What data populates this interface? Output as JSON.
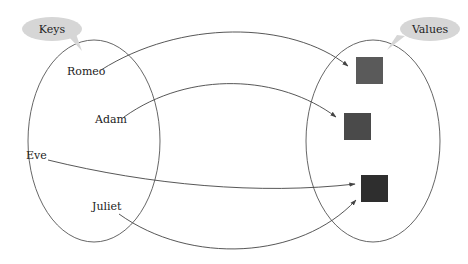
{
  "diagram": {
    "keys_set": {
      "title": "Keys",
      "items": [
        "Romeo",
        "Adam",
        "Eve",
        "Juliet"
      ]
    },
    "values_set": {
      "title": "Values",
      "items": [
        {
          "name": "value-1",
          "color": "#5a5a5a"
        },
        {
          "name": "value-2",
          "color": "#4a4a4a"
        },
        {
          "name": "value-3",
          "color": "#2e2e2e"
        }
      ]
    },
    "mappings": [
      {
        "from": "Romeo",
        "to": "value-1"
      },
      {
        "from": "Adam",
        "to": "value-2"
      },
      {
        "from": "Eve",
        "to": "value-3"
      },
      {
        "from": "Juliet",
        "to": "value-3"
      }
    ],
    "colors": {
      "outline": "#555555",
      "bubble_fill": "#d6d6d6",
      "arrow": "#444444"
    }
  }
}
